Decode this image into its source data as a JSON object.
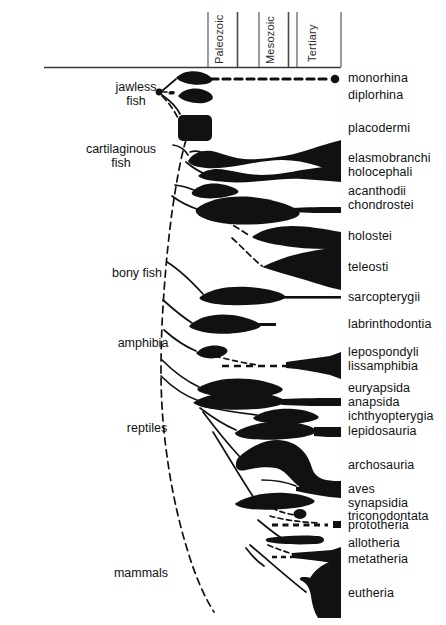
{
  "figure": {
    "type": "phylogenetic-spindle-diagram",
    "title": "",
    "axis": {
      "orientation": "horizontal-time",
      "baseline_y": 67,
      "left_x": 44,
      "right_x": 341,
      "eras": [
        {
          "name": "Paleozoic",
          "x_start": 208,
          "x_end": 237
        },
        {
          "name": "Mesozoic",
          "x_start": 259,
          "x_end": 288
        },
        {
          "name": "Tertiary",
          "x_start": 297,
          "x_end": 341
        }
      ]
    },
    "group_labels": [
      {
        "name": "jawless fish",
        "lines": [
          "jawless",
          "fish"
        ],
        "x": 136,
        "y": 86
      },
      {
        "name": "cartilaginous fish",
        "lines": [
          "cartilaginous",
          "fish"
        ],
        "x": 121,
        "y": 148
      },
      {
        "name": "bony fish",
        "lines": [
          "bony fish"
        ],
        "x": 137,
        "y": 272
      },
      {
        "name": "amphibia",
        "lines": [
          "amphibia"
        ],
        "x": 140,
        "y": 342
      },
      {
        "name": "reptiles",
        "lines": [
          "reptiles"
        ],
        "x": 143,
        "y": 427
      },
      {
        "name": "mammals",
        "lines": [
          "mammals"
        ],
        "x": 140,
        "y": 572
      }
    ],
    "taxa": [
      {
        "label": "monorhina",
        "y": 78
      },
      {
        "label": "diplorhina",
        "y": 95
      },
      {
        "label": "placodermi",
        "y": 128
      },
      {
        "label": "elasmobranchi",
        "y": 158
      },
      {
        "label": "holocephali",
        "y": 172
      },
      {
        "label": "acanthodii",
        "y": 191
      },
      {
        "label": "chondrostei",
        "y": 205
      },
      {
        "label": "holostei",
        "y": 236
      },
      {
        "label": "teleosti",
        "y": 267
      },
      {
        "label": "sarcopterygii",
        "y": 297
      },
      {
        "label": "labrinthodontia",
        "y": 324
      },
      {
        "label": "lepospondyli",
        "y": 352
      },
      {
        "label": "lissamphibia",
        "y": 366
      },
      {
        "label": "euryapsida",
        "y": 388
      },
      {
        "label": "anapsida",
        "y": 402
      },
      {
        "label": "ichthyopterygia",
        "y": 416
      },
      {
        "label": "lepidosauria",
        "y": 431
      },
      {
        "label": "archosauria",
        "y": 465
      },
      {
        "label": "aves",
        "y": 489
      },
      {
        "label": "synapsidia",
        "y": 503
      },
      {
        "label": "triconodontata",
        "y": 516
      },
      {
        "label": "prototheria",
        "y": 525
      },
      {
        "label": "allotheria",
        "y": 543
      },
      {
        "label": "metatheria",
        "y": 559
      },
      {
        "label": "eutheria",
        "y": 593
      }
    ],
    "colors": {
      "ink": "#111111",
      "background": "#ffffff",
      "rule": "#3a3a3a"
    },
    "label_column_x": 348
  }
}
